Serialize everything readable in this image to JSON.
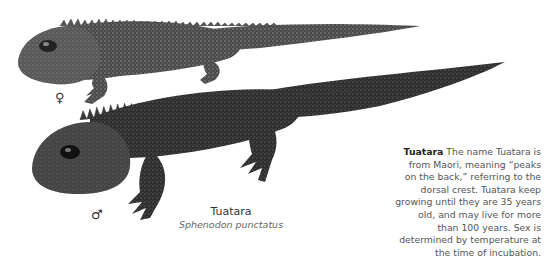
{
  "figure": {
    "subjects": [
      {
        "sex": "female",
        "symbol": "♀",
        "description": "Tuatara, upper smaller lizard"
      },
      {
        "sex": "male",
        "symbol": "♂",
        "description": "Tuatara, lower larger lizard"
      }
    ],
    "caption": {
      "common_name": "Tuatara",
      "scientific_name": "Sphenodon punctatus"
    }
  },
  "note": {
    "title": "Tuatara",
    "body": "The name Tuatara is from Maori, meaning “peaks on the back,” referring to the dorsal crest. Tuatara keep growing until they are 35 years old, and may live for more than 100 years. Sex is determined by temperature at the time of incubation."
  }
}
